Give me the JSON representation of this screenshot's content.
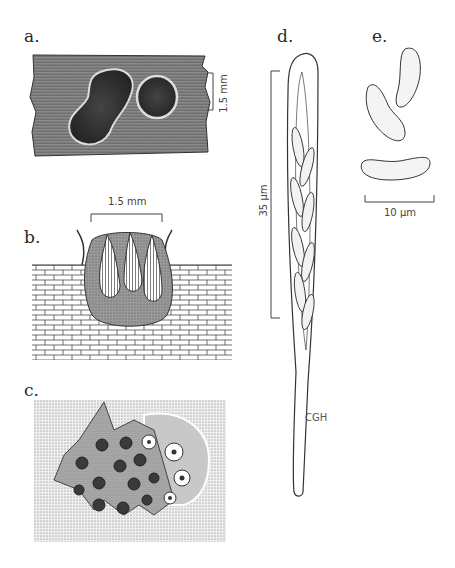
{
  "figure": {
    "panels": [
      {
        "id": "a",
        "label": "a.",
        "scale_bar": "1.5 mm",
        "description": "Two dark ascomata erumpent through bark surface"
      },
      {
        "id": "b",
        "label": "b.",
        "scale_bar": "1.5 mm",
        "description": "Vertical section of stroma with perithecia embedded in host tissue"
      },
      {
        "id": "c",
        "label": "c.",
        "description": "Stroma surface with ostioles, torn periderm flaps"
      },
      {
        "id": "d",
        "label": "d.",
        "scale_bar": "35 µm",
        "description": "Ascus with eight allantoid ascospores, long stipe"
      },
      {
        "id": "e",
        "label": "e.",
        "scale_bar": "10 µm",
        "description": "Three allantoid ascospores"
      }
    ],
    "signature": "CGH",
    "colors": {
      "ink": "#2a2a2a",
      "stipple_dark": "#555555",
      "stipple_light": "#bbbbbb",
      "background": "#ffffff"
    }
  }
}
